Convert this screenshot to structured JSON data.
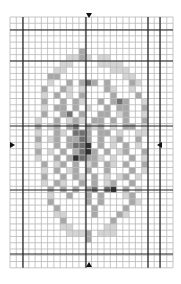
{
  "chart": {
    "grid": {
      "origin_x": 10,
      "origin_y": 17,
      "cols": 26,
      "rows": 40,
      "cell": 6.27,
      "thin_color": "#b8b8b8",
      "thick_color": "#222222",
      "thick_vertical_x": [
        23,
        86,
        148,
        160
      ],
      "thick_horizontal_y": [
        30,
        61,
        126,
        190,
        254
      ]
    },
    "frame": {
      "x": 23,
      "y": 30,
      "w": 125,
      "h": 224
    },
    "shade_colors": [
      "#ffffff",
      "#d4d4d4",
      "#a8a8a8",
      "#707070",
      "#333333"
    ],
    "center_markers": [
      "top",
      "bottom",
      "left",
      "right"
    ],
    "cells": [
      "..........................",
      "..........................",
      "..........................",
      "..........................",
      "..........................",
      "...........2..............",
      ".........1121.11..........",
      "........11....1111........",
      ".......11.......111.......",
      "......22..........11......",
      "......1..2.232.2...21.....",
      ".....2..21.1...21..1......",
      ".....1.2.1.2....2...2.....",
      ".....2..2.21..2.232..1....",
      ".....1.22.2.1..2.22..2....",
      ".....2..23.2..22.12..1....",
      "....1..2.121.22.2.2..2....",
      "....2.12.23.212.1.22.1....",
      "....1..21.332.22.1..11....",
      "....2.12.2232.2.12..2.....",
      "....1..2.2334.2.1.2.1.....",
      "....2.1.2.2342.2.12..2....",
      "....1..2.243221.1..2.1....",
      ".....2.12.2.12.21.2..2....",
      ".....1.2.12.2..2...2.1....",
      ".....2..2.21.2.1.12.1.....",
      ".....1.21..2.2.12..2......",
      "......2.2.2.23.34.2.1.....",
      "......1..2..2.2...12......",
      "......2.....2.2....21.....",
      ".......2.....2....2.......",
      ".......11....2...21.......",
      "........2.......2.........",
      "........11.....11.........",
      ".........1112.111.........",
      "............2.............",
      "..........................",
      "..........................",
      "..........................",
      ".........................."
    ]
  }
}
